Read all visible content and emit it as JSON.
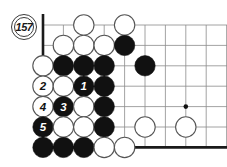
{
  "figure": {
    "kind": "go-board-diagram",
    "move_badge_label": "157",
    "colors": {
      "background": "#ffffff",
      "grid_line": "#8c8c8c",
      "board_edge": "#1a1a1a",
      "black_stone": "#111111",
      "white_stone_fill": "#ffffff",
      "white_stone_outline": "#555555",
      "star_point": "#111111",
      "label_on_black": "#ffffff",
      "label_on_white": "#111111"
    }
  },
  "board_geometry": {
    "columns": 10,
    "rows": 8,
    "spacing": 20.4,
    "origin_x": 43,
    "origin_y": 25,
    "stone_radius": 10.2,
    "left_edge_column": 1,
    "top_edge_row": 1,
    "bottom_edge_row": 7,
    "edge_line_width": 2.6,
    "grid_line_width": 0.8
  },
  "star_points": [
    {
      "col": 8,
      "row": 5
    }
  ],
  "stones": [
    {
      "col": 3,
      "row": 1,
      "color": "white",
      "label": ""
    },
    {
      "col": 5,
      "row": 1,
      "color": "white",
      "label": ""
    },
    {
      "col": 2,
      "row": 2,
      "color": "white",
      "label": ""
    },
    {
      "col": 3,
      "row": 2,
      "color": "white",
      "label": ""
    },
    {
      "col": 4,
      "row": 2,
      "color": "white",
      "label": ""
    },
    {
      "col": 5,
      "row": 2,
      "color": "black",
      "label": ""
    },
    {
      "col": 1,
      "row": 3,
      "color": "white",
      "label": ""
    },
    {
      "col": 2,
      "row": 3,
      "color": "black",
      "label": ""
    },
    {
      "col": 3,
      "row": 3,
      "color": "black",
      "label": ""
    },
    {
      "col": 4,
      "row": 3,
      "color": "black",
      "label": ""
    },
    {
      "col": 6,
      "row": 3,
      "color": "black",
      "label": ""
    },
    {
      "col": 1,
      "row": 4,
      "color": "white",
      "label": "2"
    },
    {
      "col": 2,
      "row": 4,
      "color": "white",
      "label": ""
    },
    {
      "col": 3,
      "row": 4,
      "color": "black",
      "label": "1"
    },
    {
      "col": 4,
      "row": 4,
      "color": "black",
      "label": ""
    },
    {
      "col": 1,
      "row": 5,
      "color": "white",
      "label": "4"
    },
    {
      "col": 2,
      "row": 5,
      "color": "black",
      "label": "3"
    },
    {
      "col": 3,
      "row": 5,
      "color": "white",
      "label": ""
    },
    {
      "col": 4,
      "row": 5,
      "color": "black",
      "label": ""
    },
    {
      "col": 1,
      "row": 6,
      "color": "black",
      "label": "5"
    },
    {
      "col": 2,
      "row": 6,
      "color": "white",
      "label": ""
    },
    {
      "col": 3,
      "row": 6,
      "color": "white",
      "label": ""
    },
    {
      "col": 4,
      "row": 6,
      "color": "black",
      "label": ""
    },
    {
      "col": 6,
      "row": 6,
      "color": "white",
      "label": ""
    },
    {
      "col": 8,
      "row": 6,
      "color": "white",
      "label": ""
    },
    {
      "col": 1,
      "row": 7,
      "color": "black",
      "label": ""
    },
    {
      "col": 2,
      "row": 7,
      "color": "black",
      "label": ""
    },
    {
      "col": 3,
      "row": 7,
      "color": "black",
      "label": ""
    },
    {
      "col": 4,
      "row": 7,
      "color": "white",
      "label": ""
    },
    {
      "col": 5,
      "row": 7,
      "color": "white",
      "label": ""
    }
  ],
  "move_badge": {
    "label": "157",
    "x": 11,
    "y": 14
  }
}
